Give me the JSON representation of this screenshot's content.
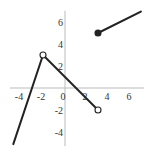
{
  "chart_data": {
    "type": "line",
    "title": "",
    "xlabel": "",
    "ylabel": "",
    "xlim": [
      -5.1,
      7.1
    ],
    "ylim": [
      -5.2,
      7.2
    ],
    "grid": false,
    "legend": null,
    "x_ticks": [
      -4,
      -2,
      0,
      2,
      4,
      6
    ],
    "y_ticks": [
      -4,
      -2,
      2,
      4,
      6
    ],
    "x_tick_labels": [
      "-4",
      "-2",
      "0",
      "2",
      "4",
      "6"
    ],
    "y_tick_labels": [
      "-4",
      "-2",
      "2",
      "4",
      "6"
    ],
    "series": [
      {
        "name": "piece-1",
        "x": [
          -4.7,
          -2
        ],
        "y": [
          -5.1,
          3
        ],
        "left_endpoint": "none",
        "right_endpoint": "open"
      },
      {
        "name": "piece-2",
        "x": [
          -2,
          3
        ],
        "y": [
          3,
          -2
        ],
        "left_endpoint": "open",
        "right_endpoint": "open"
      },
      {
        "name": "piece-3",
        "x": [
          3,
          6.9
        ],
        "y": [
          5,
          6.95
        ],
        "left_endpoint": "closed",
        "right_endpoint": "none"
      }
    ],
    "points": [
      {
        "x": -2,
        "y": 3,
        "style": "open"
      },
      {
        "x": 3,
        "y": -2,
        "style": "open"
      },
      {
        "x": 3,
        "y": 5,
        "style": "closed"
      }
    ],
    "colors": {
      "line": "#222222",
      "axis": "#bbbbbb",
      "text": "#333333"
    }
  }
}
